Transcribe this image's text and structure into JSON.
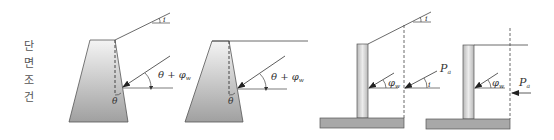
{
  "side_label": {
    "text": "단면조건",
    "chars": [
      "단",
      "면",
      "조",
      "건"
    ]
  },
  "colors": {
    "fill_light": "#f2f2f2",
    "fill_dark": "#a8a8a8",
    "stroke": "#555555",
    "text": "#333333"
  },
  "diagrams": [
    {
      "id": "gravity-sloped",
      "type": "gravity wall, sloped backfill",
      "labels": {
        "slope_angle": "i",
        "force_angle": "θ + φ",
        "force_angle_sub": "w",
        "wall_angle": "θ"
      }
    },
    {
      "id": "gravity-level",
      "type": "gravity wall, level backfill",
      "labels": {
        "force_angle": "θ + φ",
        "force_angle_sub": "w",
        "wall_angle": "θ"
      }
    },
    {
      "id": "cantilever-sloped",
      "type": "cantilever wall, sloped backfill",
      "labels": {
        "slope_angle": "i",
        "wall_friction": "φ",
        "wall_friction_sub": "w",
        "force": "P",
        "force_sub": "a",
        "force_angle": "i"
      }
    },
    {
      "id": "cantilever-level",
      "type": "cantilever wall, level backfill",
      "labels": {
        "wall_friction": "φ",
        "wall_friction_sub": "w",
        "force": "P",
        "force_sub": "a"
      }
    }
  ]
}
